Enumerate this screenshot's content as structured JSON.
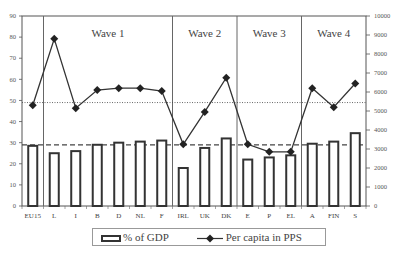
{
  "chart_data": {
    "type": "bar",
    "title": "",
    "categories": [
      "EU15",
      "L",
      "I",
      "B",
      "D",
      "NL",
      "F",
      "IRL",
      "UK",
      "DK",
      "E",
      "P",
      "EL",
      "A",
      "FIN",
      "S"
    ],
    "series": [
      {
        "name": "% of GDP",
        "type": "bar",
        "axis": "left",
        "values": [
          28.5,
          25,
          26,
          29,
          30,
          30.5,
          31,
          18,
          27.5,
          32,
          22,
          23,
          24,
          29.5,
          30.5,
          34.5
        ]
      },
      {
        "name": "Per capita in PPS",
        "type": "line",
        "axis": "right",
        "values": [
          5300,
          8800,
          5150,
          6100,
          6200,
          6200,
          6050,
          3250,
          4950,
          6750,
          3250,
          2850,
          2850,
          6200,
          5200,
          6450
        ]
      }
    ],
    "left_axis": {
      "min": 0,
      "max": 90,
      "ticks": [
        0,
        10,
        20,
        30,
        40,
        50,
        60,
        70,
        80,
        90
      ]
    },
    "right_axis": {
      "min": 0,
      "max": 10000,
      "ticks": [
        0,
        1000,
        2000,
        3000,
        4000,
        5000,
        6000,
        7000,
        8000,
        9000,
        10000
      ]
    },
    "reference_lines": [
      {
        "style": "dashed",
        "axis": "left",
        "value": 29,
        "meaning": "EU15 % of GDP average"
      },
      {
        "style": "dotted",
        "axis": "left",
        "value": 49,
        "meaning": "EU15 per capita PPS average"
      }
    ],
    "groups": [
      {
        "label": "Wave 1",
        "from": "L",
        "to": "F"
      },
      {
        "label": "Wave 2",
        "from": "IRL",
        "to": "DK"
      },
      {
        "label": "Wave 3",
        "from": "E",
        "to": "EL"
      },
      {
        "label": "Wave 4",
        "from": "A",
        "to": "S"
      }
    ],
    "legend": {
      "position": "bottom",
      "entries": [
        "% of GDP",
        "Per capita in PPS"
      ]
    },
    "grid": false
  },
  "legend": {
    "bar_label": "% of GDP",
    "line_label": "Per capita in PPS"
  }
}
